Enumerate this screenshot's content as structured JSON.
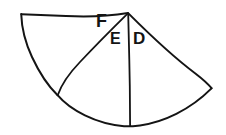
{
  "figure": {
    "kind": "hand-drawn-geometry-sketch",
    "background_color": "#ffffff",
    "stroke_color": "#141414",
    "labels": [
      {
        "id": "F",
        "text": "F",
        "x": 96,
        "y": 12
      },
      {
        "id": "E",
        "text": "E",
        "x": 110,
        "y": 31
      },
      {
        "id": "D",
        "text": "D",
        "x": 133,
        "y": 30
      }
    ],
    "geometry": {
      "apex": {
        "x": 128,
        "y": 13
      },
      "left_corner": {
        "x": 21,
        "y": 14
      },
      "arc_left_end": {
        "x": 58,
        "y": 95
      },
      "arc_bottom": {
        "x": 130,
        "y": 126
      },
      "arc_right_end": {
        "x": 212,
        "y": 88
      },
      "radius_lines": [
        {
          "from": "apex",
          "to": "left_corner",
          "name": "upper-left-edge"
        },
        {
          "from": "apex",
          "to": "arc_left_end",
          "name": "diagonal-radius"
        },
        {
          "from": "apex",
          "to": "arc_bottom",
          "name": "vertical-radius"
        },
        {
          "from": "apex",
          "to": "arc_right_end",
          "name": "right-edge"
        }
      ]
    }
  }
}
